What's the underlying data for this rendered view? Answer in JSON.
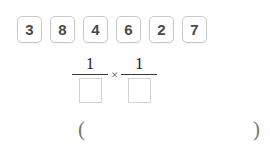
{
  "exercise": {
    "tray": {
      "label": "number tiles",
      "tiles": [
        {
          "value": "3"
        },
        {
          "value": "8"
        },
        {
          "value": "4"
        },
        {
          "value": "6"
        },
        {
          "value": "2"
        },
        {
          "value": "7"
        }
      ]
    },
    "expression": {
      "operator": "×",
      "fractions": [
        {
          "numerator": "1",
          "denominator": "",
          "denominator_placeholder": ""
        },
        {
          "numerator": "1",
          "denominator": "",
          "denominator_placeholder": ""
        }
      ]
    },
    "answer_row": {
      "open_paren": "(",
      "answer": "",
      "close_paren": ")"
    },
    "colors": {
      "tile_border": "#c9c9c9",
      "tile_text": "#4a4a4a",
      "box_border": "#d2d2d2",
      "fraction_bar": "#3a3a3a",
      "paren": "#777777",
      "background": "#ffffff"
    }
  }
}
